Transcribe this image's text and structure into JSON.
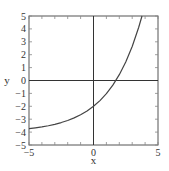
{
  "chart_data": {
    "type": "line",
    "title": "",
    "xlabel": "x",
    "ylabel": "y",
    "xlim": [
      -5,
      5
    ],
    "ylim": [
      -5,
      5
    ],
    "x_ticks": [
      -5,
      0,
      5
    ],
    "x_tick_labels": [
      "-5",
      "0",
      "5"
    ],
    "y_ticks": [
      -5,
      -4,
      -3,
      -2,
      -1,
      0,
      1,
      2,
      3,
      4,
      5
    ],
    "y_tick_labels": [
      "-5",
      "-4",
      "-3",
      "-2",
      "-1",
      "0",
      "1",
      "2",
      "3",
      "4",
      "5"
    ],
    "minor_tick_step": 1,
    "grid": false,
    "zero_axes": true,
    "legend": "none",
    "series": [
      {
        "name": "curve",
        "color": "#444444",
        "x": [
          -5,
          -4.5,
          -4,
          -3.5,
          -3,
          -2.5,
          -2,
          -1.5,
          -1,
          -0.5,
          0,
          0.5,
          1,
          1.5,
          2,
          2.5,
          3,
          3.5,
          3.76
        ],
        "y": [
          -3.73,
          -3.67,
          -3.6,
          -3.51,
          -3.4,
          -3.26,
          -3.1,
          -2.9,
          -2.66,
          -2.36,
          -2.0,
          -1.56,
          -1.02,
          -0.36,
          0.45,
          1.44,
          2.64,
          4.11,
          5.0
        ]
      }
    ],
    "annotations": {
      "y_intercept": -2,
      "x_intercept": 1.73
    }
  }
}
